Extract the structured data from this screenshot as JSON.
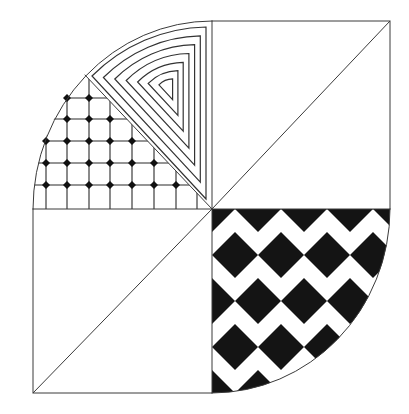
{
  "figure": {
    "ink_color": "#1a1a1a",
    "paper_color": "#ffffff",
    "sections": [
      {
        "name": "top-left-grid",
        "pattern": "grid with dots at intersections"
      },
      {
        "name": "top-left-concentric",
        "pattern": "concentric nested sectors"
      },
      {
        "name": "top-right",
        "pattern": "blank square split by diagonal"
      },
      {
        "name": "bottom-left",
        "pattern": "blank square split by diagonal"
      },
      {
        "name": "bottom-right",
        "pattern": "black and white diamond checkerboard"
      }
    ],
    "geometry": {
      "center": [
        212,
        209
      ],
      "left": 33,
      "right": 390,
      "top": 21,
      "bottom": 393
    },
    "grid": {
      "xs": [
        46,
        67,
        89,
        110,
        132,
        154,
        176,
        197
      ],
      "ys": [
        98,
        119,
        141,
        163,
        185
      ],
      "dots": [
        [
          67,
          98
        ],
        [
          89,
          98
        ],
        [
          67,
          119
        ],
        [
          89,
          119
        ],
        [
          110,
          119
        ],
        [
          46,
          141
        ],
        [
          67,
          141
        ],
        [
          89,
          141
        ],
        [
          110,
          141
        ],
        [
          132,
          141
        ],
        [
          46,
          163
        ],
        [
          67,
          163
        ],
        [
          89,
          163
        ],
        [
          110,
          163
        ],
        [
          132,
          163
        ],
        [
          154,
          163
        ],
        [
          46,
          185
        ],
        [
          67,
          185
        ],
        [
          89,
          185
        ],
        [
          110,
          185
        ],
        [
          132,
          185
        ],
        [
          154,
          185
        ],
        [
          176,
          185
        ]
      ]
    },
    "concentric": {
      "focus": [
        168,
        86
      ],
      "scales": [
        1,
        0.85,
        0.7,
        0.55,
        0.4,
        0.26,
        0.12
      ]
    },
    "checker": {
      "cell": 46,
      "origin": [
        212,
        209
      ]
    }
  }
}
